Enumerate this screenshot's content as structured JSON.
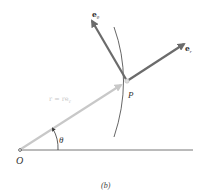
{
  "figure": {
    "caption": "(b)",
    "origin_label": "O",
    "point_label": "P",
    "angle_label": "θ",
    "position_vector_label": "r = re",
    "position_vector_subscript": "r",
    "unit_vectors": [
      {
        "name": "e",
        "subscript": "θ"
      },
      {
        "name": "e",
        "subscript": "r"
      }
    ],
    "colors": {
      "unit_vector": "#6b6b6b",
      "position_vector": "#c8c8c8",
      "position_label": "#c8c8c8",
      "lines": "#555555",
      "text": "#333333"
    }
  }
}
